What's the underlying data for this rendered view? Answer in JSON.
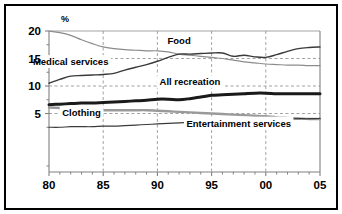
{
  "chart_data": {
    "type": "line",
    "title": "",
    "subtitle": "",
    "xlabel": "",
    "ylabel": "%",
    "unit_label": "%",
    "xlim": [
      80,
      105
    ],
    "ylim": [
      0,
      20
    ],
    "yticks": [
      5,
      10,
      15,
      20
    ],
    "ytick_labels": [
      "5",
      "10",
      "15",
      "20"
    ],
    "y_minor_ticks": [
      2.5,
      7.5,
      12.5,
      17.5
    ],
    "xticks": [
      80,
      85,
      90,
      95,
      100,
      105
    ],
    "xtick_labels": [
      "80",
      "85",
      "90",
      "95",
      "00",
      "05"
    ],
    "x_minor_ticks": [
      81,
      82,
      83,
      84,
      86,
      87,
      88,
      89,
      91,
      92,
      93,
      94,
      96,
      97,
      98,
      99,
      101,
      102,
      103,
      104
    ],
    "grid": true,
    "grid_style": "dashed",
    "grid_color": "#999999",
    "axis_color": "#808080",
    "legend_position": "inline-annotations",
    "x": [
      80,
      81,
      82,
      83,
      84,
      85,
      86,
      87,
      88,
      89,
      90,
      91,
      92,
      93,
      94,
      95,
      96,
      97,
      98,
      99,
      100,
      101,
      102,
      103,
      104,
      105
    ],
    "series": [
      {
        "name": "Food",
        "label": "Food",
        "color": "#8c8c8c",
        "width": 1.2,
        "label_x": 92.0,
        "label_y": 17.7,
        "values": [
          20.0,
          19.7,
          19.2,
          18.4,
          17.7,
          17.1,
          16.8,
          16.6,
          16.5,
          16.4,
          16.4,
          16.2,
          15.8,
          15.6,
          15.4,
          15.2,
          15.0,
          14.7,
          14.4,
          14.2,
          14.0,
          13.9,
          13.8,
          13.8,
          13.7,
          13.7
        ]
      },
      {
        "name": "Medical services",
        "label": "Medical services",
        "color": "#3a3a3a",
        "width": 1.4,
        "label_x": 82.0,
        "label_y": 13.8,
        "values": [
          10.5,
          11.2,
          11.8,
          11.9,
          12.0,
          12.1,
          12.3,
          12.9,
          13.4,
          13.9,
          14.5,
          15.2,
          15.8,
          15.8,
          15.9,
          16.0,
          16.0,
          15.4,
          15.6,
          15.3,
          15.2,
          15.7,
          16.3,
          16.8,
          17.0,
          17.1
        ]
      },
      {
        "name": "All recreation",
        "label": "All recreation",
        "color": "#1a1a1a",
        "width": 3.0,
        "label_x": 93.0,
        "label_y": 10.1,
        "values": [
          6.6,
          6.7,
          6.8,
          6.9,
          6.9,
          7.0,
          7.1,
          7.2,
          7.3,
          7.4,
          7.6,
          7.6,
          7.5,
          7.7,
          8.0,
          8.3,
          8.4,
          8.5,
          8.6,
          8.7,
          8.7,
          8.6,
          8.6,
          8.6,
          8.6,
          8.6
        ]
      },
      {
        "name": "Clothing",
        "label": "Clothing",
        "color": "#9a9a9a",
        "width": 2.4,
        "label_x": 83.0,
        "label_y": 4.5,
        "values": [
          6.1,
          6.0,
          5.9,
          5.8,
          5.7,
          5.6,
          5.6,
          5.6,
          5.6,
          5.6,
          5.5,
          5.4,
          5.3,
          5.2,
          5.1,
          5.0,
          4.9,
          4.8,
          4.7,
          4.6,
          4.5,
          4.3,
          4.2,
          4.1,
          4.0,
          4.0
        ]
      },
      {
        "name": "Entertainment services",
        "label": "Entertainment services",
        "color": "#3a3a3a",
        "width": 1.2,
        "label_x": 97.5,
        "label_y": 2.6,
        "values": [
          2.5,
          2.5,
          2.6,
          2.6,
          2.6,
          2.7,
          2.7,
          2.8,
          2.9,
          3.0,
          3.1,
          3.2,
          3.3,
          3.4,
          3.5,
          3.6,
          3.7,
          3.8,
          3.85,
          3.9,
          3.95,
          4.0,
          4.0,
          4.05,
          4.05,
          4.1
        ]
      }
    ]
  }
}
